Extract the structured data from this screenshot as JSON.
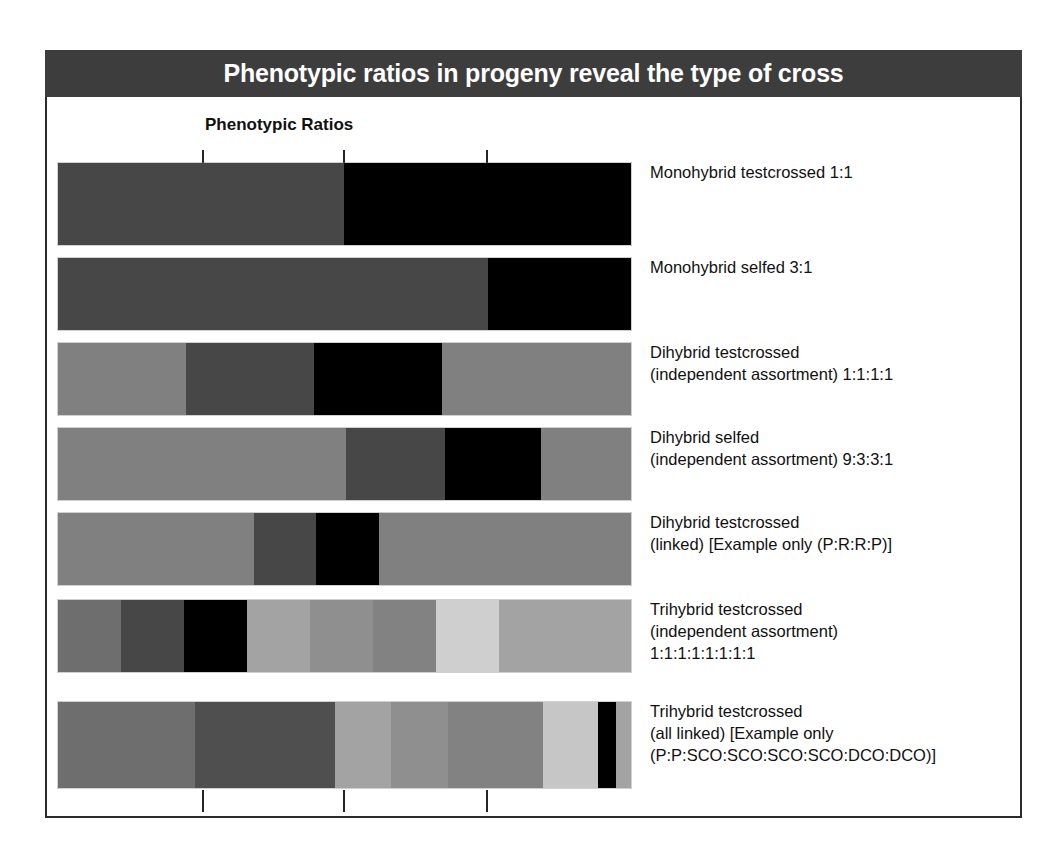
{
  "title": "Phenotypic ratios in progeny reveal the type of cross",
  "column_header": "Phenotypic Ratios",
  "colors": {
    "banner_bg": "#3d3d3d",
    "banner_text": "#ffffff",
    "frame_border": "#2b2b2b",
    "tick": "#262626",
    "page_bg": "#ffffff",
    "black": "#000000",
    "dark_gray": "#474747",
    "gray": "#6e6e6e",
    "medium_gray": "#808080",
    "light_gray": "#a3a3a3",
    "lighter_gray": "#bdbdbd",
    "lightest_gray": "#d2d2d2"
  },
  "axis": {
    "ticks_top": [
      144,
      285,
      428
    ],
    "ticks_bottom": [
      144,
      285,
      428
    ],
    "tick_count": 3,
    "bar_track_width": 573
  },
  "chart_data": {
    "type": "bar",
    "orientation": "horizontal",
    "title": "Phenotypic ratios in progeny reveal the type of cross",
    "subtitle": "Phenotypic Ratios",
    "xlabel": "",
    "ylabel": "",
    "grid": false,
    "legend": "none",
    "note": "Stacked horizontal bars; each segment width is proportional to its share of the ratio. Bar total lengths differ between rows.",
    "categories": [
      "Monohybrid testcrossed 1:1",
      "Monohybrid selfed 3:1",
      "Dihybrid testcrossed (independent assortment) 1:1:1:1",
      "Dihybrid selfed (independent assortment) 9:3:3:1",
      "Dihybrid testcrossed (linked) [Example only (P:R:R:P)]",
      "Trihybrid testcrossed (independent assortment) 1:1:1:1:1:1:1:1",
      "Trihybrid testcrossed (all linked) [Example only (P:P:SCO:SCO:SCO:SCO:DCO:DCO)]"
    ],
    "rows": [
      {
        "id": "monohybrid-testcrossed",
        "label_lines": [
          "Monohybrid testcrossed 1:1"
        ],
        "ratio": "1:1",
        "ratio_values": [
          1,
          1
        ],
        "total_width": 573,
        "top": 163,
        "height": 82,
        "segments": [
          {
            "share": 1,
            "width": 286,
            "color": "#474747"
          },
          {
            "share": 1,
            "width": 287,
            "color": "#000000"
          }
        ]
      },
      {
        "id": "monohybrid-selfed",
        "label_lines": [
          "Monohybrid selfed 3:1"
        ],
        "ratio": "3:1",
        "ratio_values": [
          3,
          1
        ],
        "total_width": 573,
        "top": 258,
        "height": 72,
        "segments": [
          {
            "share": 3,
            "width": 430,
            "color": "#474747"
          },
          {
            "share": 1,
            "width": 143,
            "color": "#000000"
          }
        ]
      },
      {
        "id": "dihybrid-testcrossed-independent",
        "label_lines": [
          "Dihybrid testcrossed",
          "(independent assortment) 1:1:1:1"
        ],
        "ratio": "1:1:1:1",
        "ratio_values": [
          1,
          1,
          1,
          1
        ],
        "total_width": 573,
        "top": 343,
        "height": 72,
        "segments": [
          {
            "share": 1,
            "width": 128,
            "color": "#808080"
          },
          {
            "share": 1,
            "width": 128,
            "color": "#474747"
          },
          {
            "share": 1,
            "width": 128,
            "color": "#000000"
          },
          {
            "share": 1,
            "width": 189,
            "color": "#808080"
          }
        ]
      },
      {
        "id": "dihybrid-selfed-independent",
        "label_lines": [
          "Dihybrid selfed",
          "(independent assortment) 9:3:3:1"
        ],
        "ratio": "9:3:3:1",
        "ratio_values": [
          9,
          3,
          3,
          1
        ],
        "total_width": 573,
        "top": 428,
        "height": 72,
        "segments": [
          {
            "share": 9,
            "width": 288,
            "color": "#808080"
          },
          {
            "share": 3,
            "width": 99,
            "color": "#474747"
          },
          {
            "share": 3,
            "width": 96,
            "color": "#000000"
          },
          {
            "share": 1,
            "width": 90,
            "color": "#808080"
          }
        ]
      },
      {
        "id": "dihybrid-testcrossed-linked",
        "label_lines": [
          "Dihybrid testcrossed",
          "(linked) [Example only (P:R:R:P)]"
        ],
        "ratio": "P:R:R:P",
        "ratio_values": [
          6.5,
          1.5,
          1.5,
          6.5
        ],
        "total_width": 573,
        "top": 513,
        "height": 72,
        "segments": [
          {
            "share": 6.5,
            "width": 196,
            "color": "#808080"
          },
          {
            "share": 1.5,
            "width": 62,
            "color": "#474747"
          },
          {
            "share": 1.5,
            "width": 63,
            "color": "#000000"
          },
          {
            "share": 6.5,
            "width": 252,
            "color": "#808080"
          }
        ]
      },
      {
        "id": "trihybrid-testcrossed-independent",
        "label_lines": [
          "Trihybrid testcrossed",
          "(independent assortment)",
          "1:1:1:1:1:1:1:1"
        ],
        "ratio": "1:1:1:1:1:1:1:1",
        "ratio_values": [
          1,
          1,
          1,
          1,
          1,
          1,
          1,
          1
        ],
        "total_width": 573,
        "top": 600,
        "height": 72,
        "segments": [
          {
            "share": 1,
            "width": 63,
            "color": "#6e6e6e"
          },
          {
            "share": 1,
            "width": 63,
            "color": "#474747"
          },
          {
            "share": 1,
            "width": 63,
            "color": "#000000"
          },
          {
            "share": 1,
            "width": 63,
            "color": "#a3a3a3"
          },
          {
            "share": 1,
            "width": 63,
            "color": "#8f8f8f"
          },
          {
            "share": 1,
            "width": 63,
            "color": "#828282"
          },
          {
            "share": 1,
            "width": 63,
            "color": "#cfcfcf"
          },
          {
            "share": 1,
            "width": 132,
            "color": "#a3a3a3"
          }
        ]
      },
      {
        "id": "trihybrid-testcrossed-linked",
        "label_lines": [
          "Trihybrid testcrossed",
          "(all linked) [Example only",
          "(P:P:SCO:SCO:SCO:SCO:DCO:DCO)]"
        ],
        "ratio": "P:P:SCO:SCO:SCO:SCO:DCO:DCO",
        "ratio_values": [
          4.3,
          4.3,
          1.7,
          1.8,
          2.9,
          1.7,
          0.55,
          0.45
        ],
        "total_width": 573,
        "top": 702,
        "height": 86,
        "segments": [
          {
            "share": 4.3,
            "width": 137,
            "color": "#6e6e6e"
          },
          {
            "share": 4.3,
            "width": 140,
            "color": "#4f4f4f"
          },
          {
            "share": 1.7,
            "width": 56,
            "color": "#a3a3a3"
          },
          {
            "share": 1.8,
            "width": 57,
            "color": "#8f8f8f"
          },
          {
            "share": 2.9,
            "width": 95,
            "color": "#828282"
          },
          {
            "share": 1.7,
            "width": 55,
            "color": "#c6c6c6"
          },
          {
            "share": 0.55,
            "width": 18,
            "color": "#000000"
          },
          {
            "share": 0.45,
            "width": 15,
            "color": "#a3a3a3"
          }
        ]
      }
    ]
  }
}
